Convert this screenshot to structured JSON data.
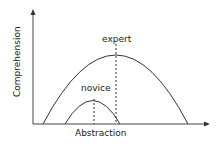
{
  "diagram": {
    "y_axis_label": "Comprehension",
    "x_axis_label": "Abstraction",
    "curves": [
      {
        "name": "expert",
        "label": "expert",
        "start_x": 43,
        "peak_x": 116,
        "peak_y": 55,
        "end_x": 188
      },
      {
        "name": "novice",
        "label": "novice",
        "start_x": 65,
        "peak_x": 94,
        "peak_y": 100,
        "end_x": 120
      }
    ],
    "colors": {
      "line": "#333333",
      "background": "#ffffff"
    }
  }
}
